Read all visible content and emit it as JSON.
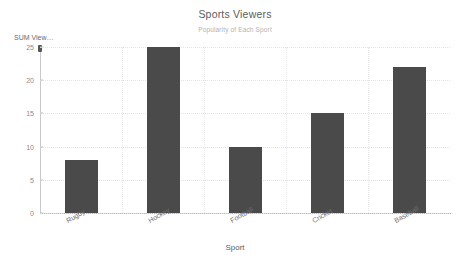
{
  "chart_data": {
    "type": "bar",
    "title": "Sports Viewers",
    "subtitle": "Popularity of Each Sport",
    "xlabel": "Sport",
    "ylabel": "SUM View…",
    "categories": [
      "Rugby",
      "Hockey",
      "Football",
      "Cricket",
      "Baseball"
    ],
    "values": [
      8,
      25,
      10,
      15,
      22
    ],
    "yticks": [
      0,
      5,
      10,
      15,
      20,
      25
    ],
    "ylim": [
      0,
      25
    ],
    "grid": true,
    "legend": false,
    "bar_color": "#4a4a4a",
    "title_color": "#5d5d5d",
    "subtitle_color": "#b2b2b2",
    "gridline_color": "#e2e2e8",
    "axis_color": "#b9b9b9",
    "tick_label_color": "#8a8a8a"
  }
}
